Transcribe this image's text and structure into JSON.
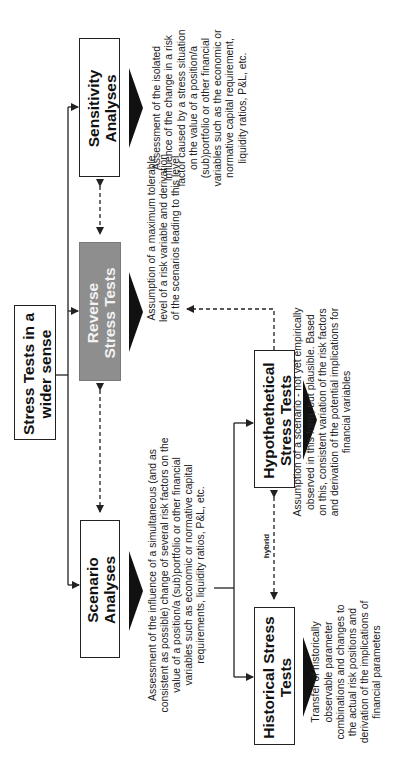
{
  "diagram": {
    "orientation": "rotated -90deg (reads bottom-to-top)",
    "root": {
      "label": "Stress Tests in a wider sense"
    },
    "nodes": [
      {
        "id": "sensitivity",
        "label": "Sensitivity Analyses",
        "description": "Assessment of the isolated influence of the change in a risk factor caused by a stress situation on the value of a position/a (sub)portfolio or other financial variables such as the economic or normative capital requirement, liquidity ratios, P&L, etc."
      },
      {
        "id": "reverse",
        "label": "Reverse Stress Tests",
        "highlight_color": "#8e8e8e",
        "description": "Assumption of a maximum tolerable level of a risk variable and derivation of the scenarios leading to this level"
      },
      {
        "id": "scenario",
        "label": "Scenario Analyses",
        "description": "Assessment of the influence of a simultaneous (and as consistent as possible) change of several risk factors on the value of a position/a (sub)portfolio or other financial variables such as economic or normative capital requirements, liquidity ratios, P&L, etc."
      },
      {
        "id": "hypothetical",
        "label": "Hypothethetical Stress Tests",
        "description": "Assumption of a scenario - not yet empirically observed in this form, but plausible. Based on this, consistent variation of the risk factors and derivation of the potential implications for financial variables"
      },
      {
        "id": "historical",
        "label": "Historical Stress Tests",
        "description": "Transfer of historically observable parameter combinations and changes to the actual risk positions and derivation of the implications of financial parameters"
      }
    ],
    "edges": [
      {
        "from": "root",
        "to": "sensitivity",
        "style": "solid"
      },
      {
        "from": "root",
        "to": "reverse",
        "style": "solid"
      },
      {
        "from": "root",
        "to": "scenario",
        "style": "solid"
      },
      {
        "from": "scenario",
        "to": "hypothetical",
        "style": "solid"
      },
      {
        "from": "scenario",
        "to": "historical",
        "style": "solid"
      },
      {
        "from": "sensitivity",
        "to": "reverse",
        "style": "dashed-bidirectional"
      },
      {
        "from": "reverse",
        "to": "scenario",
        "style": "dashed-bidirectional"
      },
      {
        "from": "hypothetical",
        "to": "historical",
        "style": "dashed-bidirectional",
        "label": "hybrid"
      },
      {
        "from": "hypothetical",
        "to": "reverse",
        "style": "dashed"
      }
    ]
  }
}
